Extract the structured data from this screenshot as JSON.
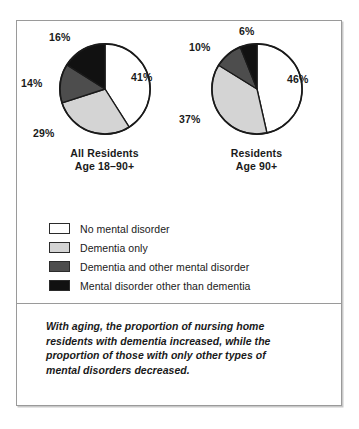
{
  "figure": {
    "note": "With aging, the proportion of nursing home residents with dementia increased, while the proportion of those with only other types of mental disorders decreased."
  },
  "legend": {
    "items": [
      {
        "key": "no-mental-disorder",
        "label": "No mental disorder",
        "color": "#ffffff"
      },
      {
        "key": "dementia-only",
        "label": "Dementia only",
        "color": "#d4d4d4"
      },
      {
        "key": "dementia-and-other",
        "label": "Dementia and other mental disorder",
        "color": "#4d4d4d"
      },
      {
        "key": "other-than-dementia",
        "label": "Mental disorder other than dementia",
        "color": "#111111"
      }
    ]
  },
  "chart_data": [
    {
      "type": "pie",
      "name": "all-residents",
      "title": "All Residents",
      "subtitle": "Age 18–90+",
      "categories": [
        "No mental disorder",
        "Dementia only",
        "Dementia and other mental disorder",
        "Mental disorder other than dementia"
      ],
      "values": [
        41,
        29,
        14,
        16
      ],
      "labels": [
        "41%",
        "29%",
        "14%",
        "16%"
      ],
      "colors": [
        "#ffffff",
        "#d4d4d4",
        "#4d4d4d",
        "#111111"
      ],
      "start_angle_deg": 0,
      "direction": "clockwise",
      "units": "percent"
    },
    {
      "type": "pie",
      "name": "residents-age-90-plus",
      "title": "Residents",
      "subtitle": "Age 90+",
      "categories": [
        "No mental disorder",
        "Dementia only",
        "Dementia and other mental disorder",
        "Mental disorder other than dementia"
      ],
      "values": [
        46,
        37,
        10,
        6
      ],
      "labels": [
        "46%",
        "37%",
        "10%",
        "6%"
      ],
      "colors": [
        "#ffffff",
        "#d4d4d4",
        "#4d4d4d",
        "#111111"
      ],
      "start_angle_deg": 0,
      "direction": "clockwise",
      "units": "percent"
    }
  ]
}
